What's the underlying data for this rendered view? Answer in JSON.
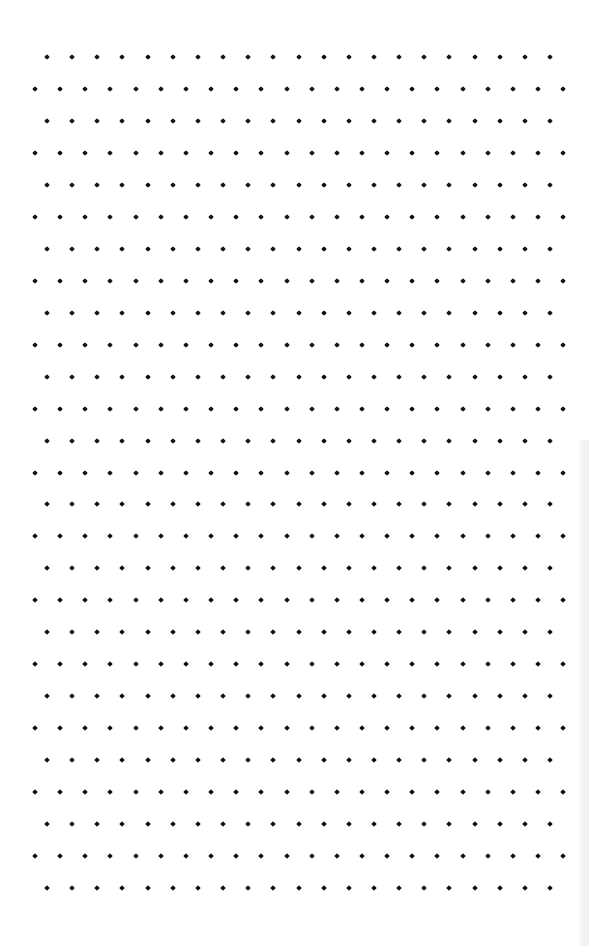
{
  "page": {
    "type": "isometric dot grid paper",
    "background": "#ffffff",
    "dot_color": "#111111"
  },
  "grid": {
    "rows": 27,
    "first_row_y": 57,
    "row_spacing": 31.96,
    "odd_rows": {
      "first_x": 47,
      "count": 21
    },
    "even_rows": {
      "first_x": 35,
      "count": 22
    },
    "col_spacing": 25.15,
    "dot_size": 4
  }
}
